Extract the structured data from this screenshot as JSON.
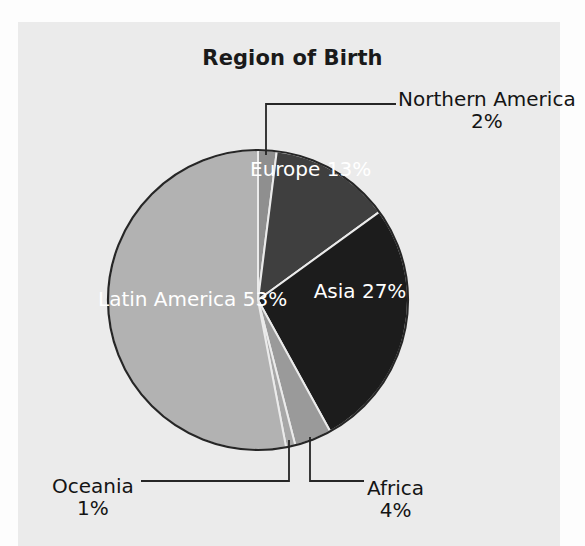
{
  "chart_data": {
    "type": "pie",
    "title": "Region of Birth",
    "xlabel": "",
    "ylabel": "",
    "legend_position": "none",
    "grid": false,
    "value_unit": "%",
    "categories": [
      "Northern America",
      "Europe",
      "Asia",
      "Africa",
      "Oceania",
      "Latin America"
    ],
    "values": [
      2,
      13,
      27,
      4,
      1,
      53
    ],
    "labels": [
      "2%",
      "13%",
      "27%",
      "4%",
      "1%",
      "53%"
    ],
    "slice_colors": [
      "#8f8f8f",
      "#3f3f3f",
      "#1c1c1c",
      "#9a9a9a",
      "#a8a8a8",
      "#b2b2b2"
    ],
    "label_placement": [
      "outside",
      "inside",
      "inside",
      "outside",
      "outside",
      "inside"
    ],
    "start_angle_deg": 0,
    "direction": "clockwise",
    "slices": [
      {
        "name": "Northern America",
        "value": 2,
        "label": "2%",
        "color": "#8f8f8f",
        "placement": "outside"
      },
      {
        "name": "Europe",
        "value": 13,
        "label": "13%",
        "color": "#3f3f3f",
        "placement": "inside"
      },
      {
        "name": "Asia",
        "value": 27,
        "label": "27%",
        "color": "#1c1c1c",
        "placement": "inside"
      },
      {
        "name": "Africa",
        "value": 4,
        "label": "4%",
        "color": "#9a9a9a",
        "placement": "outside"
      },
      {
        "name": "Oceania",
        "value": 1,
        "label": "1%",
        "color": "#a8a8a8",
        "placement": "outside"
      },
      {
        "name": "Latin America",
        "value": 53,
        "label": "53%",
        "color": "#b2b2b2",
        "placement": "inside"
      }
    ]
  },
  "figure": {
    "title": "Region of Birth",
    "background_color": "#ebebeb",
    "outline_color": "#262626"
  },
  "labels": {
    "northern_america": {
      "name": "Northern America",
      "pct": "2%"
    },
    "europe": {
      "name": "Europe",
      "pct": "13%"
    },
    "asia": {
      "name": "Asia",
      "pct": "27%"
    },
    "africa": {
      "name": "Africa",
      "pct": "4%"
    },
    "oceania": {
      "name": "Oceania",
      "pct": "1%"
    },
    "latin_america": {
      "name": "Latin America",
      "pct": "53%"
    }
  }
}
